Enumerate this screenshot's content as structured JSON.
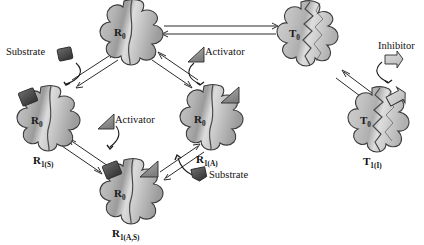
{
  "figure": {
    "kind": "allosteric-enzyme-state-diagram",
    "background_color": "#ffffff",
    "enzyme_fill_light": "#d9d9d9",
    "enzyme_fill_dark": "#8f8f8f",
    "enzyme_outline": "#3a3a3a",
    "substrate_color": "#4a4a4a",
    "activator_color": "#9a9a9a",
    "inhibitor_color": "#c8c8c8",
    "arrow_color": "#2b2b2b"
  },
  "states": [
    {
      "id": "r0-top",
      "inner_label": "R",
      "inner_sub": "0",
      "caption": "",
      "caption_sub": "",
      "conformation": "relaxed"
    },
    {
      "id": "r1s",
      "inner_label": "R",
      "inner_sub": "0",
      "caption": "R",
      "caption_sub": "1(S)",
      "conformation": "relaxed"
    },
    {
      "id": "r1a",
      "inner_label": "R",
      "inner_sub": "0",
      "caption": "R",
      "caption_sub": "1(A)",
      "conformation": "relaxed"
    },
    {
      "id": "r1as",
      "inner_label": "R",
      "inner_sub": "0",
      "caption": "R",
      "caption_sub": "1(A,S)",
      "conformation": "relaxed"
    },
    {
      "id": "t0",
      "inner_label": "T",
      "inner_sub": "0",
      "caption": "",
      "caption_sub": "",
      "conformation": "tense"
    },
    {
      "id": "t1i",
      "inner_label": "T",
      "inner_sub": "0",
      "caption": "T",
      "caption_sub": "1(I)",
      "conformation": "tense"
    }
  ],
  "ligands": [
    {
      "id": "substrate-left",
      "label": "Substrate",
      "shape": "square"
    },
    {
      "id": "activator-upper",
      "label": "Activator",
      "shape": "triangle"
    },
    {
      "id": "activator-lower",
      "label": "Activator",
      "shape": "triangle"
    },
    {
      "id": "substrate-right",
      "label": "Substrate",
      "shape": "square"
    },
    {
      "id": "inhibitor",
      "label": "Inhibitor",
      "shape": "flag"
    }
  ],
  "equilibria": [
    {
      "id": "r0-to-t0",
      "from": "r0-top",
      "to": "t0",
      "type": "double-arrow"
    },
    {
      "id": "r0-to-r1s",
      "from": "r0-top",
      "to": "r1s",
      "type": "double-arrow"
    },
    {
      "id": "r0-to-r1a",
      "from": "r0-top",
      "to": "r1a",
      "type": "double-arrow"
    },
    {
      "id": "r1s-to-r1as",
      "from": "r1s",
      "to": "r1as",
      "type": "double-arrow"
    },
    {
      "id": "r1as-to-r1a",
      "from": "r1as",
      "to": "r1a",
      "type": "double-arrow"
    },
    {
      "id": "t0-to-t1i",
      "from": "t0",
      "to": "t1i",
      "type": "double-arrow"
    }
  ]
}
